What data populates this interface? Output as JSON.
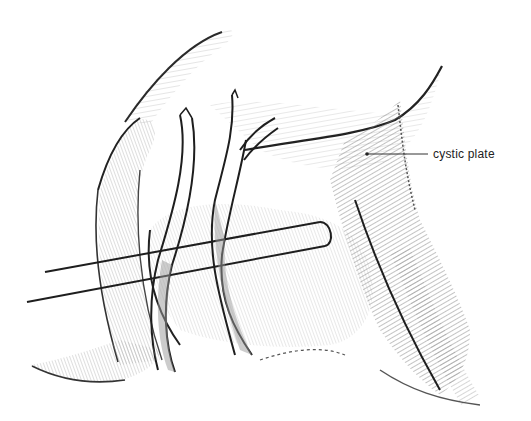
{
  "figure": {
    "style": "grayscale pencil surgical illustration",
    "labels": [
      {
        "text": "cystic plate",
        "x": 433,
        "y": 155
      }
    ],
    "colors": {
      "ink": "#1a1a1a",
      "shade": "#8a8a8a",
      "light": "#cfcfcf",
      "background": "#ffffff"
    }
  }
}
